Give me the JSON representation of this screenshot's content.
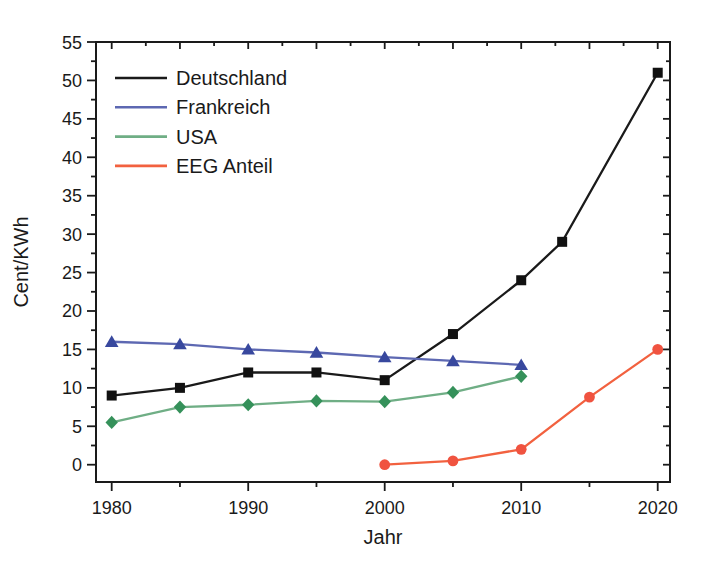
{
  "figure": {
    "background": "#ffffff",
    "frame_color": "#1a1a1a",
    "text_color": "#1a1a1a"
  },
  "chart_data": {
    "type": "line",
    "title": "",
    "xlabel": "Jahr",
    "ylabel": "Cent/KWh",
    "xlim": [
      1978.85,
      2020.9
    ],
    "ylim": [
      -2.25,
      55
    ],
    "x_major_ticks": [
      1980,
      1990,
      2000,
      2010,
      2020
    ],
    "x_minor_ticks": [
      1985,
      1995,
      2005,
      2015
    ],
    "x_edge_tick_start": 1980,
    "x_edge_tick_end": 2020,
    "x_edge_tick_step": 2.5,
    "y_major_ticks": [
      0,
      5,
      10,
      15,
      20,
      25,
      30,
      35,
      40,
      45,
      50,
      55
    ],
    "y_minor_ticks": [
      2.5,
      7.5,
      12.5,
      17.5,
      22.5,
      27.5,
      32.5,
      37.5,
      42.5,
      47.5,
      52.5
    ],
    "y_edge_tick_start": 0,
    "y_edge_tick_end": 55,
    "y_edge_tick_step": 2.5,
    "grid": false,
    "legend_position": "top-left",
    "series": [
      {
        "name": "Deutschland",
        "marker": "square",
        "marker_color": "#111111",
        "line_color": "#1a1a1a",
        "points": [
          [
            1980,
            9
          ],
          [
            1985,
            10
          ],
          [
            1990,
            12
          ],
          [
            1995,
            12
          ],
          [
            2000,
            11
          ],
          [
            2005,
            17
          ],
          [
            2010,
            24
          ],
          [
            2013,
            29
          ],
          [
            2020,
            51
          ]
        ]
      },
      {
        "name": "Frankreich",
        "marker": "triangle",
        "marker_color": "#38489e",
        "line_color": "#5d68b2",
        "points": [
          [
            1980,
            16
          ],
          [
            1985,
            15.7
          ],
          [
            1990,
            15
          ],
          [
            1995,
            14.6
          ],
          [
            2000,
            14
          ],
          [
            2005,
            13.5
          ],
          [
            2010,
            13
          ]
        ]
      },
      {
        "name": "USA",
        "marker": "diamond",
        "marker_color": "#35915a",
        "line_color": "#6fae85",
        "points": [
          [
            1980,
            5.5
          ],
          [
            1985,
            7.5
          ],
          [
            1990,
            7.8
          ],
          [
            1995,
            8.3
          ],
          [
            2000,
            8.2
          ],
          [
            2005,
            9.4
          ],
          [
            2010,
            11.5
          ]
        ]
      },
      {
        "name": "EEG Anteil",
        "marker": "circle",
        "marker_color": "#f05340",
        "line_color": "#f2613f",
        "points": [
          [
            2000,
            0
          ],
          [
            2005,
            0.5
          ],
          [
            2010,
            2
          ],
          [
            2015,
            8.8
          ],
          [
            2020,
            15
          ]
        ]
      }
    ]
  }
}
